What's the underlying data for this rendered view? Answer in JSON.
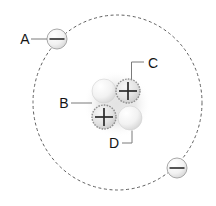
{
  "diagram": {
    "labels": {
      "a": "A",
      "b": "B",
      "c": "C",
      "d": "D"
    },
    "icons": {
      "proton_charge": "plus-icon",
      "electron_charge": "minus-icon",
      "orbit": "dashed-orbit-circle"
    },
    "particles": {
      "electron_count": 2,
      "proton_count": 2,
      "neutron_count": 2
    },
    "colors": {
      "background": "#ffffff",
      "orbit_dash": "#5f5f5f",
      "label_text": "#141414",
      "connector_line": "#7a7a7a",
      "charge_symbol": "#2a2a2a",
      "proton_rim": "#8f8f8f",
      "electron_rim": "#a8a8a8",
      "nucleus_glow": "#e3e3e3"
    }
  }
}
